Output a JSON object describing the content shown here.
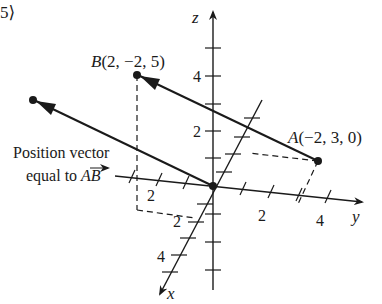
{
  "header": {
    "fragment": "5⟩"
  },
  "axes": {
    "x_label": "x",
    "y_label": "y",
    "z_label": "z",
    "x_ticks": [
      "2",
      "4"
    ],
    "y_ticks": [
      "2",
      "4"
    ],
    "z_ticks": [
      "2",
      "4"
    ],
    "neg_y_tick": "2",
    "neg_x_tick": "2"
  },
  "points": {
    "A": {
      "name": "A",
      "coords": "(−2, 3, 0)"
    },
    "B": {
      "name": "B",
      "coords": "(2, −2, 5)"
    }
  },
  "annotation": {
    "line1": "Position vector",
    "line2_prefix": "equal to ",
    "line2_vector": "AB"
  },
  "colors": {
    "ink": "#1a1a1a",
    "background": "#ffffff"
  }
}
